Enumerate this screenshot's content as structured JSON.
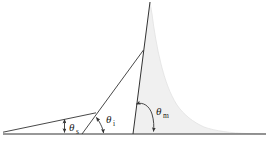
{
  "figure": {
    "type": "line-diagram",
    "background_color": "#ffffff",
    "line_color": "#333333",
    "fill_color": "#f0f0f0",
    "width": 272,
    "height": 146
  },
  "baseline": {
    "label": "",
    "y": 134,
    "x_start": 3,
    "x_end": 266
  },
  "angles": [
    {
      "id": "theta-s",
      "symbol": "θ",
      "subscript": "s",
      "label": "θs",
      "label_x": 70,
      "label_y": 130,
      "marker": "vertical-double-arrow",
      "vertex_x": 3,
      "vertex_y": 134
    },
    {
      "id": "theta-i",
      "symbol": "θ",
      "subscript": "i",
      "label": "θi",
      "label_x": 107,
      "label_y": 121,
      "marker": "double-headed-arc",
      "vertex_x": 95,
      "vertex_y": 113
    },
    {
      "id": "theta-m",
      "symbol": "θ",
      "subscript": "m",
      "label": "θm",
      "label_x": 157,
      "label_y": 113,
      "marker": "double-headed-arc",
      "vertex_x": 133,
      "vertex_y": 134
    }
  ],
  "lines": [
    {
      "id": "shallow-slope-line",
      "name": "shallow slope line",
      "from": [
        3,
        132
      ],
      "to": [
        95,
        113
      ]
    },
    {
      "id": "intermediate-slope-line",
      "name": "intermediate slope line",
      "from": [
        82,
        134
      ],
      "to": [
        143,
        50
      ]
    },
    {
      "id": "steep-summit-line",
      "name": "steep summit line",
      "from": [
        133,
        134
      ],
      "to": [
        150,
        2
      ]
    }
  ],
  "peak": {
    "id": "mountain-profile",
    "name": "shaded mountain profile",
    "apex": [
      150,
      2
    ],
    "base_left": [
      133,
      134
    ],
    "base_right": [
      266,
      134
    ]
  }
}
